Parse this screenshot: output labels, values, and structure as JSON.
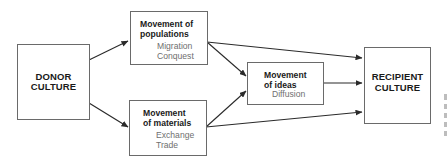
{
  "diagram": {
    "nodes": {
      "donor": {
        "label_line1": "DONOR",
        "label_line2": "CULTURE"
      },
      "populations": {
        "title_line1": "Movement of",
        "title_line2": "populations",
        "items": [
          "Migration",
          "Conquest"
        ]
      },
      "materials": {
        "title_line1": "Movement",
        "title_line2": "of materials",
        "items": [
          "Exchange",
          "Trade"
        ]
      },
      "ideas": {
        "title_line1": "Movement",
        "title_line2": "of ideas",
        "items": [
          "Diffusion"
        ]
      },
      "recipient": {
        "label_line1": "RECIPIENT",
        "label_line2": "CULTURE"
      }
    },
    "edges": [
      {
        "from": "donor",
        "to": "populations"
      },
      {
        "from": "donor",
        "to": "materials"
      },
      {
        "from": "populations",
        "to": "recipient"
      },
      {
        "from": "populations",
        "to": "ideas"
      },
      {
        "from": "materials",
        "to": "ideas"
      },
      {
        "from": "materials",
        "to": "recipient"
      },
      {
        "from": "ideas",
        "to": "recipient"
      }
    ],
    "colors": {
      "line": "#2a2a2a",
      "box_border": "#6a6a6a",
      "subtext": "#6f6f6f"
    }
  }
}
